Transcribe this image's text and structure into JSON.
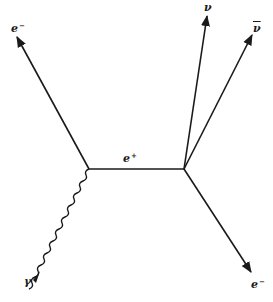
{
  "diagram": {
    "type": "feynman",
    "line_color": "#1a1a1a",
    "vertices": [
      {
        "id": "v1",
        "x": 89,
        "y": 169
      },
      {
        "id": "v2",
        "x": 184,
        "y": 169
      }
    ],
    "particles": {
      "electron_in": {
        "label": "e",
        "charge": "−"
      },
      "photon": {
        "label": "γ"
      },
      "positron_internal": {
        "label": "e",
        "charge": "+"
      },
      "neutrino": {
        "label": "ν"
      },
      "antineutrino": {
        "label": "ν"
      },
      "electron_out": {
        "label": "e",
        "charge": "−"
      }
    }
  }
}
